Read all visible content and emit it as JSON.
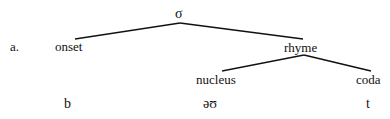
{
  "example_label": "a.",
  "nodes": {
    "root": "σ",
    "onset": "onset",
    "rhyme": "rhyme",
    "nucleus": "nucleus",
    "coda": "coda"
  },
  "segments": {
    "onset": "b",
    "nucleus": "əʊ",
    "coda": "t"
  },
  "colors": {
    "line": "#111111",
    "background": "#ffffff"
  }
}
